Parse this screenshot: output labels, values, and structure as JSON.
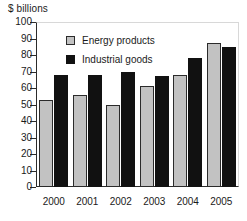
{
  "chart_data": {
    "type": "bar",
    "title": "",
    "ylabel": "$ billions",
    "xlabel": "",
    "ylim": [
      0,
      100
    ],
    "yticks": [
      0,
      10,
      20,
      30,
      40,
      50,
      60,
      70,
      80,
      90,
      100
    ],
    "grid": false,
    "legend_position": "inside-top-left",
    "categories": [
      "2000",
      "2001",
      "2002",
      "2003",
      "2004",
      "2005"
    ],
    "series": [
      {
        "name": "Energy products",
        "color": "#c2c2c2",
        "values": [
          53,
          56,
          50,
          61,
          68,
          87
        ]
      },
      {
        "name": "Industrial goods",
        "color": "#111111",
        "values": [
          68,
          68,
          70,
          67,
          78,
          85
        ]
      }
    ]
  },
  "axis": {
    "y_title": "$ billions",
    "tick_labels": [
      "100",
      "90",
      "80",
      "70",
      "60",
      "50",
      "40",
      "30",
      "20",
      "10",
      "0"
    ],
    "category_labels": [
      "2000",
      "2001",
      "2002",
      "2003",
      "2004",
      "2005"
    ]
  },
  "legend": {
    "items": [
      {
        "label": "Energy products",
        "swatch": "gray-square-swatch"
      },
      {
        "label": "Industrial goods",
        "swatch": "black-square-swatch"
      }
    ]
  }
}
